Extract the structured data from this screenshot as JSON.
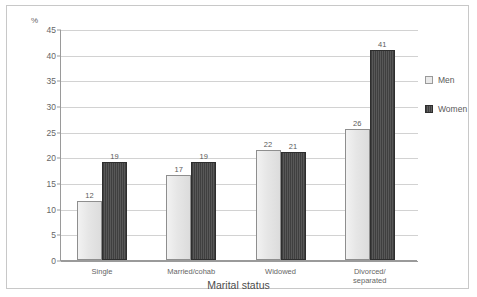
{
  "figure": {
    "unit_label": "%",
    "xaxis_title": "Marital status"
  },
  "legend": {
    "position": "right",
    "items": [
      {
        "label": "Men",
        "color": "#eaeaea"
      },
      {
        "label": "Women",
        "color": "#4a4a4a"
      }
    ]
  },
  "yaxis": {
    "ticks": [
      "0",
      "5",
      "10",
      "15",
      "20",
      "25",
      "30",
      "35",
      "40",
      "45"
    ]
  },
  "chart_data": {
    "type": "bar",
    "title": "",
    "subtitle": "",
    "xlabel": "Marital status",
    "ylabel": "%",
    "ylim": [
      0,
      45
    ],
    "ytick_step": 5,
    "grid": true,
    "legend_position": "right",
    "categories": [
      "Single",
      "Married/cohab",
      "Widowed",
      "Divorced/\nseparated"
    ],
    "series": [
      {
        "name": "Men",
        "values": [
          12,
          17,
          22,
          26
        ]
      },
      {
        "name": "Women",
        "values": [
          19,
          19,
          21,
          41
        ]
      }
    ]
  }
}
